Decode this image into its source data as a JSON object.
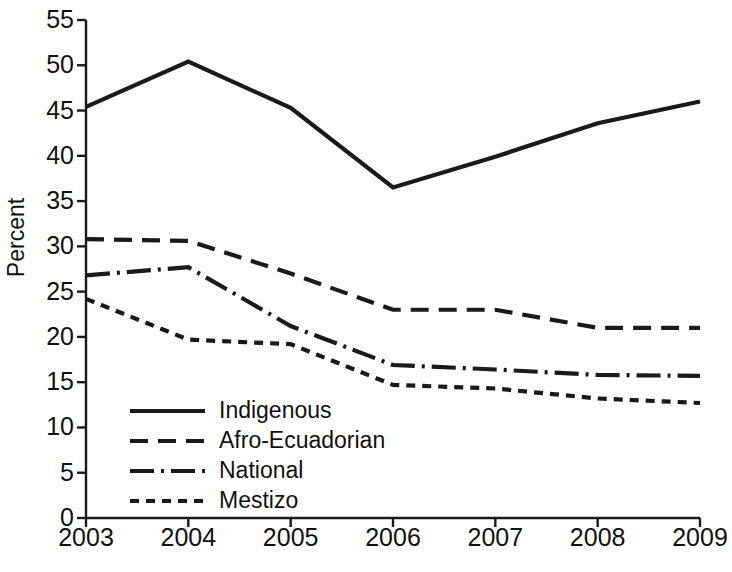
{
  "chart_data": {
    "type": "line",
    "title": "",
    "xlabel": "",
    "ylabel": "Percent",
    "x": [
      2003,
      2004,
      2005,
      2006,
      2007,
      2008,
      2009
    ],
    "categories": [
      "2003",
      "2004",
      "2005",
      "2006",
      "2007",
      "2008",
      "2009"
    ],
    "xlim": [
      2003,
      2009
    ],
    "ylim": [
      0,
      55
    ],
    "yticks": [
      0,
      5,
      10,
      15,
      20,
      25,
      30,
      35,
      40,
      45,
      50,
      55
    ],
    "ytick_labels": [
      "0",
      "5",
      "10",
      "15",
      "20",
      "25",
      "30",
      "35",
      "40",
      "45",
      "50",
      "55"
    ],
    "xticks": [
      2003,
      2004,
      2005,
      2006,
      2007,
      2008,
      2009
    ],
    "xtick_labels": [
      "2003",
      "2004",
      "2005",
      "2006",
      "2007",
      "2008",
      "2009"
    ],
    "grid": false,
    "legend_position": "lower-left-inside",
    "line_color": "#1a1a1a",
    "series": [
      {
        "name": "Indigenous",
        "style": "solid",
        "dash": "none",
        "values": [
          45.4,
          50.4,
          45.3,
          36.5,
          39.9,
          43.6,
          46.0
        ]
      },
      {
        "name": "Afro-Ecuadorian",
        "style": "dashed",
        "dash": "18,10",
        "values": [
          30.8,
          30.6,
          27.0,
          23.0,
          23.0,
          21.0,
          21.0
        ]
      },
      {
        "name": "National",
        "style": "dash-dot",
        "dash": "24,7,3,7",
        "values": [
          26.8,
          27.7,
          21.2,
          16.9,
          16.4,
          15.8,
          15.7
        ]
      },
      {
        "name": "Mestizo",
        "style": "dotted",
        "dash": "9,7",
        "values": [
          24.2,
          19.7,
          19.2,
          14.7,
          14.3,
          13.2,
          12.7
        ]
      }
    ]
  },
  "legend": {
    "items": [
      {
        "label": "Indigenous"
      },
      {
        "label": "Afro-Ecuadorian"
      },
      {
        "label": "National"
      },
      {
        "label": "Mestizo"
      }
    ]
  }
}
